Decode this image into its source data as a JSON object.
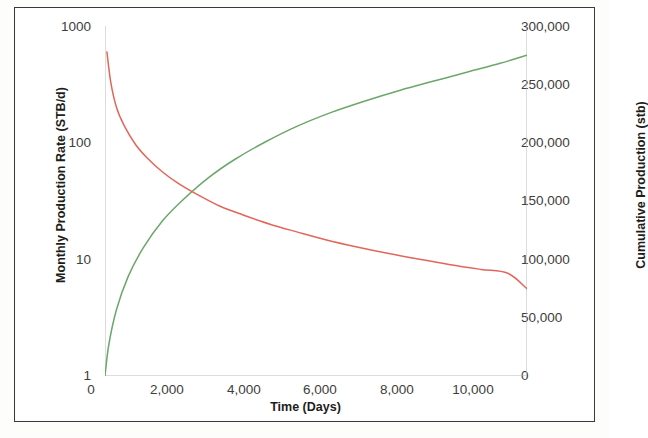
{
  "chart_data": {
    "type": "line",
    "title": "",
    "subtitle": "",
    "xlabel": "Time (Days)",
    "ylabel": "Monthly Production Rate (STB/d)",
    "y2label": "Cumulative Production (stb)",
    "xlim": [
      0,
      11000
    ],
    "ylim": [
      1,
      1000
    ],
    "y2lim": [
      0,
      300000
    ],
    "yscale": "log",
    "y2scale": "linear",
    "xscale": "linear",
    "grid": false,
    "legend": null,
    "legend_position": "none",
    "xticks": [
      0,
      2000,
      4000,
      6000,
      8000,
      10000
    ],
    "xtick_labels": [
      "0",
      "2,000",
      "4,000",
      "6,000",
      "8,000",
      "10,000"
    ],
    "yticks": [
      1,
      10,
      100,
      1000
    ],
    "ytick_labels": [
      "1",
      "10",
      "100",
      "1000"
    ],
    "y2ticks": [
      0,
      50000,
      100000,
      150000,
      200000,
      250000,
      300000
    ],
    "y2tick_labels": [
      "0",
      "50,000",
      "100,000",
      "150,000",
      "200,000",
      "250,000",
      "300,000"
    ],
    "series": [
      {
        "name": "Monthly Production Rate",
        "axis": "left",
        "color": "#e2665a",
        "x": [
          50,
          150,
          300,
          500,
          800,
          1100,
          1500,
          1900,
          2400,
          3000,
          3600,
          4300,
          5000,
          5800,
          6600,
          7400,
          8200,
          9000,
          9800,
          10500,
          11000
        ],
        "y": [
          600,
          330,
          200,
          140,
          96,
          74,
          56,
          45,
          36,
          28.5,
          24,
          20,
          17.2,
          14.6,
          12.7,
          11.2,
          10.0,
          9.0,
          8.2,
          7.6,
          5.6
        ]
      },
      {
        "name": "Cumulative Production",
        "axis": "right",
        "color": "#6ba76b",
        "x": [
          0,
          100,
          300,
          600,
          1000,
          1500,
          2000,
          2700,
          3400,
          4200,
          5000,
          5900,
          6800,
          7700,
          8600,
          9500,
          10300,
          11000
        ],
        "y": [
          0,
          27000,
          57000,
          85000,
          110000,
          133000,
          150000,
          170000,
          186000,
          201000,
          214000,
          226000,
          236000,
          245000,
          253000,
          261000,
          268000,
          275000
        ]
      }
    ],
    "annotations": []
  },
  "axes": {
    "left_title": "Monthly Production Rate (STB/d)",
    "right_title": "Cumulative Production (stb)",
    "bottom_title": "Time (Days)"
  },
  "colors": {
    "rate_curve": "#e2665a",
    "cumulative_curve": "#6ba76b",
    "axis": "#b9b9b4",
    "frame": "#3a3a38",
    "tick_text": "#3d3d3b",
    "title_text": "#1d1d1b",
    "background": "#ffffff"
  }
}
